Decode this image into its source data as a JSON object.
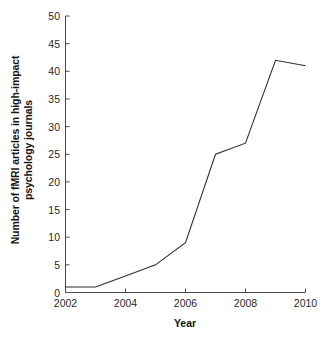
{
  "chart_data": {
    "type": "line",
    "title": "",
    "subtitle": "",
    "xlabel": "Year",
    "ylabel": "Number of fMRI articles in high-impact psychology journals",
    "ylabel_line1": "Number of fMRI articles in high-impact",
    "ylabel_line2": "psychology journals",
    "x": [
      2002,
      2003,
      2004,
      2005,
      2006,
      2007,
      2008,
      2009,
      2010
    ],
    "values": [
      1,
      1,
      3,
      5,
      9,
      25,
      27,
      42,
      41
    ],
    "series": [
      {
        "name": "fMRI articles",
        "values": [
          1,
          1,
          3,
          5,
          9,
          25,
          27,
          42,
          41
        ]
      }
    ],
    "xlim": [
      2002,
      2010
    ],
    "ylim": [
      0,
      50
    ],
    "xticks": [
      2002,
      2004,
      2006,
      2008,
      2010
    ],
    "xtick_labels": [
      "2002",
      "2004",
      "2006",
      "2008",
      "2010"
    ],
    "yticks": [
      0,
      5,
      10,
      15,
      20,
      25,
      30,
      35,
      40,
      45,
      50
    ],
    "ytick_labels": [
      "0",
      "5",
      "10",
      "15",
      "20",
      "25",
      "30",
      "35",
      "40",
      "45",
      "50"
    ],
    "grid": false,
    "legend": false,
    "legend_position": "none",
    "line_color": "#2b2b2b",
    "background_color": "#ffffff",
    "axis_color": "#4a4a4a",
    "annotations": []
  }
}
